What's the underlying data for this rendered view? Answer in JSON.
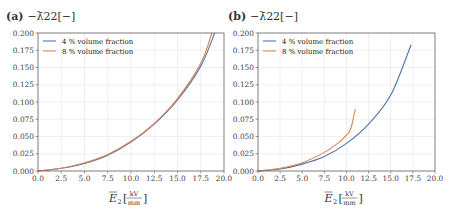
{
  "chart_data": [
    {
      "type": "line",
      "panel": "(a)",
      "title": "−λ̄22[−]",
      "xlabel": "Ē2[kV/mm]",
      "ylabel": "",
      "xlim": [
        0,
        20
      ],
      "ylim": [
        0,
        0.2
      ],
      "xticks": [
        "0.0",
        "2.5",
        "5.0",
        "7.5",
        "10.0",
        "12.5",
        "15.0",
        "17.5",
        "20.0"
      ],
      "yticks": [
        "0.000",
        "0.025",
        "0.050",
        "0.075",
        "0.100",
        "0.125",
        "0.150",
        "0.175",
        "0.200"
      ],
      "grid": true,
      "legend_position": "upper left",
      "series": [
        {
          "name": "4 % volume fraction",
          "color": "#4c72b0",
          "x": [
            0,
            2.5,
            5,
            7.5,
            10,
            12.5,
            15,
            17.5,
            19.0
          ],
          "y": [
            0.0,
            0.004,
            0.011,
            0.023,
            0.042,
            0.068,
            0.103,
            0.152,
            0.2
          ]
        },
        {
          "name": "8 % volume fraction",
          "color": "#dd8452",
          "x": [
            0,
            2.5,
            5,
            7.5,
            10,
            12.5,
            15,
            17.5,
            18.7
          ],
          "y": [
            0.0,
            0.004,
            0.012,
            0.024,
            0.043,
            0.069,
            0.105,
            0.156,
            0.2
          ]
        }
      ]
    },
    {
      "type": "line",
      "panel": "(b)",
      "title": "−λ̄22[−]",
      "xlabel": "Ē2[kV/mm]",
      "ylabel": "",
      "xlim": [
        0,
        20
      ],
      "ylim": [
        0,
        0.2
      ],
      "xticks": [
        "0.0",
        "2.5",
        "5.0",
        "7.5",
        "10.0",
        "12.5",
        "15.0",
        "17.5",
        "20.0"
      ],
      "yticks": [
        "0.000",
        "0.025",
        "0.050",
        "0.075",
        "0.100",
        "0.125",
        "0.150",
        "0.175",
        "0.200"
      ],
      "grid": true,
      "legend_position": "upper left",
      "series": [
        {
          "name": "4 % volume fraction",
          "color": "#4c72b0",
          "x": [
            0,
            2.5,
            5,
            7.5,
            10,
            12.5,
            15,
            17.3
          ],
          "y": [
            0.0,
            0.003,
            0.01,
            0.021,
            0.04,
            0.068,
            0.11,
            0.183
          ]
        },
        {
          "name": "8 % volume fraction",
          "color": "#dd8452",
          "x": [
            0,
            2.5,
            5,
            7.5,
            9,
            10,
            10.5,
            11.0
          ],
          "y": [
            0.0,
            0.004,
            0.012,
            0.027,
            0.04,
            0.052,
            0.062,
            0.09
          ]
        }
      ]
    }
  ]
}
